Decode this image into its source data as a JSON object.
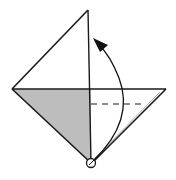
{
  "diagram": {
    "type": "origami-fold-diagram",
    "colors": {
      "line": "#1a1a1a",
      "shaded_face": "#bdbdbd",
      "paper": "#ffffff",
      "arrow": "#111111"
    },
    "shapes": {
      "left_face": "12,89 88,10 88,89",
      "shaded_triangle": "12,89 91,89 91,163",
      "right_flap": "91,89 166,89 91,163"
    },
    "elements": [
      {
        "name": "center-vertical-crease",
        "kind": "line"
      },
      {
        "name": "horizontal-edge",
        "kind": "line"
      },
      {
        "name": "valley-fold-dashed-line",
        "kind": "dashed-line"
      },
      {
        "name": "fold-arrow",
        "kind": "curved-arrow",
        "direction": "up"
      },
      {
        "name": "pivot-point",
        "kind": "circle-marker"
      }
    ]
  }
}
